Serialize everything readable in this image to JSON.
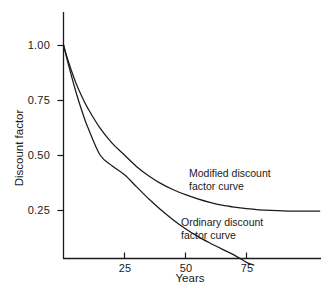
{
  "chart_data": {
    "type": "line",
    "title": "",
    "xlabel": "Years",
    "ylabel": "Discount factor",
    "xlim": [
      0,
      105
    ],
    "ylim": [
      0,
      1.08
    ],
    "grid": false,
    "legend_position": "inline-annotations",
    "xticks": [
      25,
      50,
      75
    ],
    "xtick_labels": [
      "25",
      "50",
      "75"
    ],
    "yticks": [
      0.25,
      0.5,
      0.75,
      1.0
    ],
    "ytick_labels": [
      "0.25",
      "0.50",
      "0.75",
      "1.00"
    ],
    "line_color": "#1a1a1a",
    "axis_color": "#1a1a1a",
    "background_color": "#ffffff",
    "series": [
      {
        "name": "Modified discount factor curve",
        "annotation": "Modified discount\nfactor curve",
        "x": [
          0,
          2,
          5,
          8,
          10,
          15,
          20,
          25,
          30,
          35,
          40,
          45,
          50,
          55,
          60,
          65,
          70,
          75,
          80,
          85,
          90,
          95,
          100,
          105
        ],
        "values": [
          1.0,
          0.925,
          0.83,
          0.755,
          0.712,
          0.622,
          0.553,
          0.5,
          0.447,
          0.405,
          0.37,
          0.342,
          0.32,
          0.301,
          0.285,
          0.272,
          0.263,
          0.256,
          0.251,
          0.248,
          0.246,
          0.245,
          0.245,
          0.245
        ]
      },
      {
        "name": "Ordinary discount factor curve",
        "annotation": "Ordinary discount\nfactor curve",
        "x": [
          0,
          2,
          5,
          8,
          10,
          15,
          20,
          25,
          30,
          35,
          40,
          45,
          50,
          55,
          60,
          65,
          70,
          75,
          78
        ],
        "values": [
          1.0,
          0.912,
          0.79,
          0.685,
          0.625,
          0.5,
          0.45,
          0.41,
          0.355,
          0.3,
          0.25,
          0.205,
          0.165,
          0.13,
          0.1,
          0.072,
          0.045,
          0.012,
          0.0
        ]
      }
    ]
  },
  "axis": {
    "ylabel": "Discount factor",
    "xlabel": "Years"
  }
}
